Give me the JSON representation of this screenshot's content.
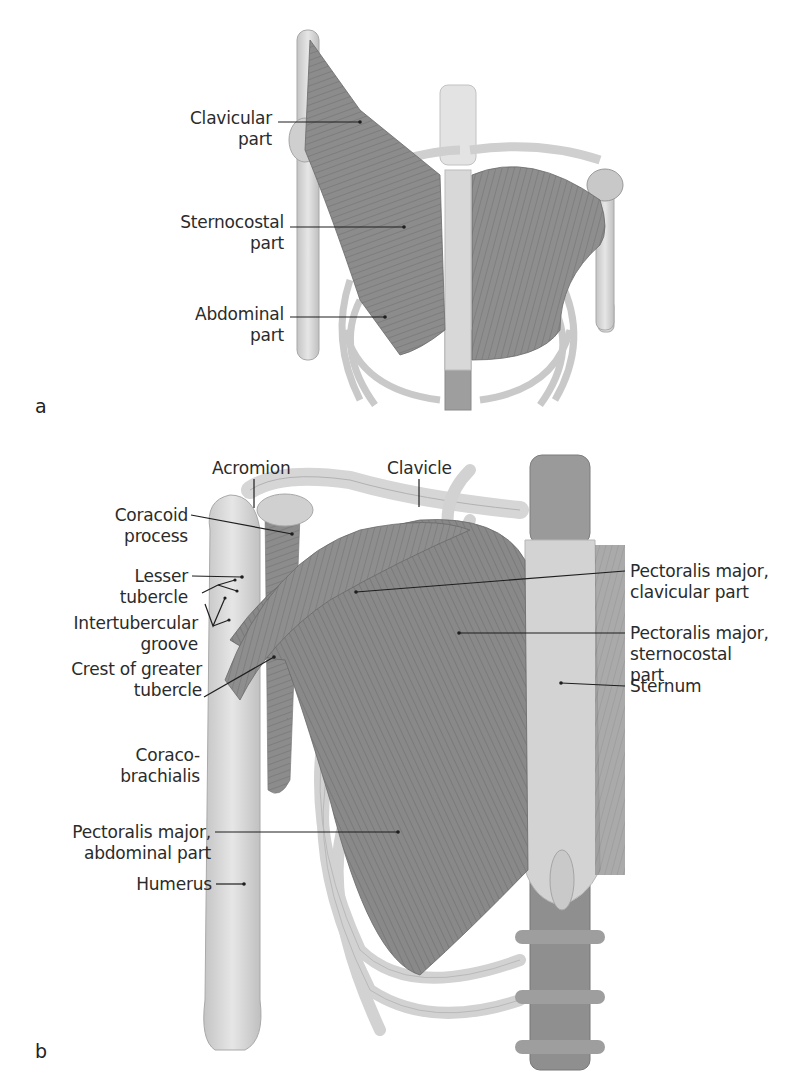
{
  "figure": {
    "panels": [
      {
        "letter": "a",
        "labels": [
          {
            "line1": "Clavicular",
            "line2": "part"
          },
          {
            "line1": "Sternocostal",
            "line2": "part"
          },
          {
            "line1": "Abdominal",
            "line2": "part"
          }
        ]
      },
      {
        "letter": "b",
        "labels": {
          "acromion": "Acromion",
          "clavicle": "Clavicle",
          "coracoid_1": "Coracoid",
          "coracoid_2": "process",
          "lesser_1": "Lesser",
          "lesser_2": "tubercle",
          "intertub_1": "Intertubercular",
          "intertub_2": "groove",
          "crest_1": "Crest of greater",
          "crest_2": "tubercle",
          "coraco_1": "Coraco-",
          "coraco_2": "brachialis",
          "pmab_1": "Pectoralis major,",
          "pmab_2": "abdominal part",
          "humerus": "Humerus",
          "pmcl_1": "Pectoralis major,",
          "pmcl_2": "clavicular part",
          "pmst_1": "Pectoralis major,",
          "pmst_2": "sternocostal",
          "pmst_3": "part",
          "sternum": "Sternum"
        }
      }
    ],
    "colors": {
      "muscle": "#8a8a8a",
      "muscle_dark": "#6e6e6e",
      "bone": "#d9d9d9",
      "bone_shade": "#bdbdbd",
      "leader_line": "#1e1e1e",
      "text": "#2b2b2b"
    }
  }
}
